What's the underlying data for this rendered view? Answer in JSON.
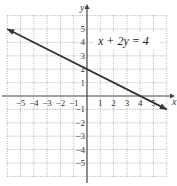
{
  "chart_data": {
    "type": "line",
    "title": "",
    "equation_label": "x + 2y = 4",
    "xlabel": "x",
    "ylabel": "y",
    "xlim": [
      -6,
      6
    ],
    "ylim": [
      -6,
      6
    ],
    "grid": true,
    "grid_style": "dotted",
    "x_ticks": [
      "-5",
      "-4",
      "-3",
      "-2",
      "-1",
      "1",
      "2",
      "3",
      "4",
      "5"
    ],
    "y_ticks": [
      "5",
      "4",
      "3",
      "2",
      "1",
      "-1",
      "-2",
      "-3",
      "-4",
      "-5"
    ],
    "series": [
      {
        "name": "x + 2y = 4",
        "x": [
          -6,
          -4,
          -2,
          0,
          2,
          4,
          6
        ],
        "y": [
          5,
          4,
          3,
          2,
          1,
          0,
          -1
        ],
        "arrows": "both",
        "color": "#333333"
      }
    ]
  }
}
